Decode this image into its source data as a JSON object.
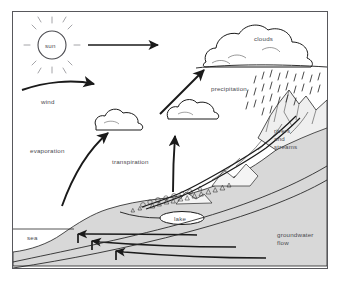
{
  "diagram": {
    "frame": {
      "stroke": "#58585c"
    },
    "colors": {
      "ink": "#1a1a1a",
      "label_text": "#4a4a4f",
      "land_fill": "#d8d8d8",
      "mountain_fill": "#efefef",
      "frame": "#58585c"
    },
    "labels": {
      "sun": "sun",
      "wind": "wind",
      "clouds": "clouds",
      "precipitation": "precipitation",
      "evaporation": "evaporation",
      "transpiration": "transpiration",
      "rivers_and_streams": "rivers\nand\nstreams",
      "lake": "lake",
      "sea": "sea",
      "groundwater_flow": "groundwater\nflow"
    },
    "elements": {
      "sun_icon": "sun-icon",
      "cloud_large": "cloud-icon",
      "cloud_mid": "cloud-icon",
      "cloud_small": "cloud-icon",
      "rain": "rain-icon",
      "mountain": "mountain-icon",
      "trees": "tree-icon",
      "arrow_sun": "arrow-right-icon",
      "arrow_wind": "arrow-curved-right-icon",
      "arrow_evaporation": "arrow-curved-up-icon",
      "arrow_transpiration": "arrow-up-icon",
      "arrow_to_clouds": "arrow-diagonal-up-icon",
      "arrow_groundwater_1": "arrow-left-icon",
      "arrow_groundwater_2": "arrow-left-icon",
      "arrow_groundwater_3": "arrow-left-icon"
    }
  }
}
